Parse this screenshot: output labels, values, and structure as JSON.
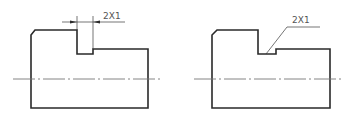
{
  "figure": {
    "views": [
      {
        "name": "dimension-style-annotation",
        "groove_callout": "2X1",
        "callout_style": "dimension line with arrows"
      },
      {
        "name": "leader-style-annotation",
        "groove_callout": "2X1",
        "callout_style": "leader line"
      }
    ],
    "line_color": "#2a2a2a",
    "centerline_color": "#777777",
    "text_color": "#555555"
  }
}
